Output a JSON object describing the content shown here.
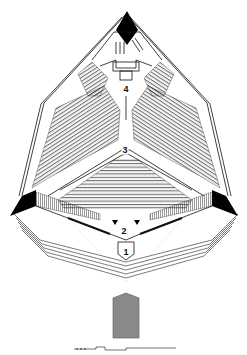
{
  "diagram": {
    "type": "architectural-floor-plan",
    "colors": {
      "line": "#111111",
      "solid": "#000000",
      "section_fill": "#8a8a8a",
      "background": "#ffffff"
    },
    "labels": [
      {
        "id": "1",
        "text": "1",
        "x": 125,
        "y": 253
      },
      {
        "id": "2",
        "text": "2",
        "x": 124,
        "y": 232
      },
      {
        "id": "3",
        "text": "3",
        "x": 125,
        "y": 150
      },
      {
        "id": "4",
        "text": "4",
        "x": 126,
        "y": 89
      }
    ],
    "elements": [
      "pyramidal-outer-walls",
      "top-apex-solid-pier",
      "left-solid-pier",
      "right-solid-pier",
      "upper-left-seating-block",
      "upper-right-seating-block",
      "central-lower-seating-block",
      "stage-area-1",
      "foyer-area-2",
      "auditorium-area-3",
      "rear-area-4",
      "concentric-entry-steps",
      "section-elevation-block",
      "scale-bar"
    ]
  }
}
